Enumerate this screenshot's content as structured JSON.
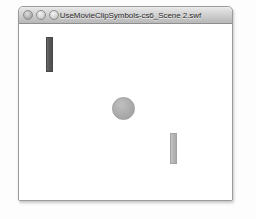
{
  "window": {
    "title": "UseMovieClipSymbols-cs6_Scene 2.swf",
    "controls": [
      {
        "name": "close",
        "label": "",
        "color": "#b4b4b4"
      },
      {
        "name": "minimize",
        "label": "",
        "color": "#d3d3d3"
      },
      {
        "name": "zoom",
        "label": "",
        "color": "#d3d3d3"
      }
    ],
    "titlebar_color": "#d2d2d2",
    "border_color": "#9a9a9a",
    "background_color": "#ffffff"
  },
  "stage": {
    "background_color": "#ffffff",
    "shapes": [
      {
        "name": "dark-bar",
        "type": "rectangle",
        "color": "#575757",
        "x": 27,
        "y": 13,
        "width": 7,
        "height": 35
      },
      {
        "name": "ball",
        "type": "circle",
        "color": "#ababab",
        "x": 93,
        "y": 73,
        "width": 23,
        "height": 23
      },
      {
        "name": "light-bar",
        "type": "rectangle",
        "color": "#b5b5b5",
        "x": 151,
        "y": 109,
        "width": 7,
        "height": 31
      }
    ]
  }
}
